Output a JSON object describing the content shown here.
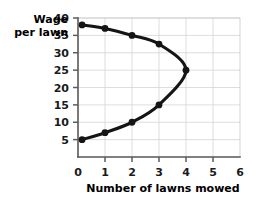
{
  "chart_data": {
    "type": "line",
    "title": "",
    "subtitle": "",
    "xlabel": "Number of lawns mowed",
    "ylabel_line1": "Wage",
    "ylabel_line2": "per lawn",
    "ylabel": "Wage per lawn",
    "xlim": [
      0,
      6
    ],
    "ylim": [
      0,
      40
    ],
    "xticks": [
      0,
      1,
      2,
      3,
      4,
      5,
      6
    ],
    "xtick_labels": [
      "0",
      "1",
      "2",
      "3",
      "4",
      "5",
      "6"
    ],
    "yticks": [
      5,
      10,
      15,
      20,
      25,
      30,
      35,
      40
    ],
    "ytick_labels": [
      "5",
      "10",
      "15",
      "20",
      "25",
      "30",
      "35",
      "40"
    ],
    "grid": true,
    "grid_axis": "both",
    "legend": false,
    "legend_position": "none",
    "annotations": [],
    "series": [
      {
        "name": "Backward-bending labor supply",
        "marker": "circle",
        "marker_color": "#151515",
        "line_color": "#151515",
        "points": [
          {
            "x": 0.15,
            "y": 5,
            "label": "(0, 5)"
          },
          {
            "x": 1.0,
            "y": 7,
            "label": "(1, 7)"
          },
          {
            "x": 2.0,
            "y": 10,
            "label": "(2, 10)"
          },
          {
            "x": 3.0,
            "y": 15,
            "label": "(3, 15)"
          },
          {
            "x": 4.0,
            "y": 25,
            "label": "(4, 25)"
          },
          {
            "x": 3.0,
            "y": 32.5,
            "label": "(3, 32.5)"
          },
          {
            "x": 2.0,
            "y": 35,
            "label": "(2, 35)"
          },
          {
            "x": 1.0,
            "y": 37,
            "label": "(1, 37)"
          },
          {
            "x": 0.15,
            "y": 38,
            "label": "(0, 38)"
          }
        ]
      }
    ]
  },
  "colors": {
    "curve": "#151515",
    "grid": "#d4d4d4",
    "axis": "#5d5d5d",
    "text": "#000000",
    "background": "#ffffff"
  }
}
